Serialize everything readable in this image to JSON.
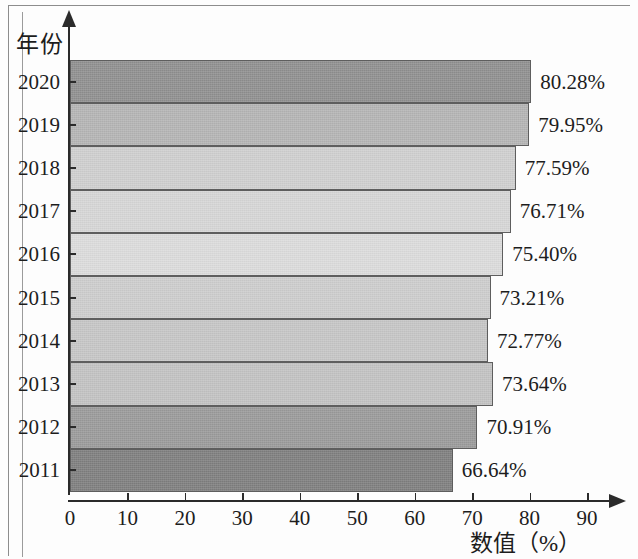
{
  "chart_data": {
    "type": "bar",
    "orientation": "horizontal",
    "title": "",
    "xlabel": "数值（%）",
    "ylabel": "年份",
    "categories": [
      "2020",
      "2019",
      "2018",
      "2017",
      "2016",
      "2015",
      "2014",
      "2013",
      "2012",
      "2011"
    ],
    "values": [
      80.28,
      79.95,
      77.59,
      76.71,
      75.4,
      73.21,
      72.77,
      73.64,
      70.91,
      66.64
    ],
    "value_labels": [
      "80.28%",
      "79.95%",
      "77.59%",
      "76.71%",
      "75.40%",
      "73.21%",
      "72.77%",
      "73.64%",
      "70.91%",
      "66.64%"
    ],
    "bar_colors": [
      "#8f8f8f",
      "#b4b4b4",
      "#cfcfcf",
      "#d6d6d6",
      "#dcdcdc",
      "#cdcdcd",
      "#c6c6c6",
      "#c2c2c2",
      "#9a9a9a",
      "#7e7e7e"
    ],
    "xlim": [
      0,
      95
    ],
    "x_ticks": [
      0,
      10,
      20,
      30,
      40,
      50,
      60,
      70,
      80,
      90
    ],
    "x_tick_labels": [
      "0",
      "10",
      "20",
      "30",
      "40",
      "50",
      "60",
      "70",
      "80",
      "90"
    ],
    "grid": false,
    "legend": "none",
    "axis_color": "#2b2b2b",
    "bar_edge_color": "#5e5e5e"
  }
}
